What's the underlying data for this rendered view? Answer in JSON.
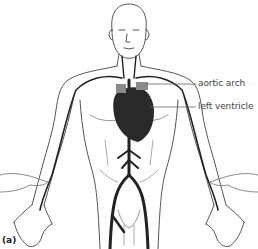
{
  "figure": {
    "panel_label": "(a)",
    "labels": {
      "aortic_arch": "aortic arch",
      "left_ventricle": "left ventricle"
    },
    "colors": {
      "outline": "#555555",
      "artery": "#222222",
      "heart": "#2a2a2a",
      "vessel_gray": "#8a8a8a",
      "leader_line": "#666666"
    }
  }
}
